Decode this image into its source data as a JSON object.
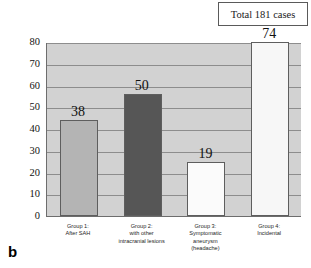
{
  "panel_letter": "b",
  "total_box": {
    "text": "Total 181 cases"
  },
  "chart_data": {
    "type": "bar",
    "title": "",
    "xlabel": "",
    "ylabel": "Number",
    "ylim": [
      0,
      80
    ],
    "yticks": [
      0,
      10,
      20,
      30,
      40,
      50,
      60,
      70,
      80
    ],
    "grid": true,
    "legend": "none",
    "annotations": [
      "Total 181 cases"
    ],
    "categories": [
      "Group 1: After SAH",
      "Group 2: with other intracranial lesions",
      "Group 3: Symptomatic aneurysm (headache)",
      "Group 4: Incidental"
    ],
    "category_lines": [
      [
        "Group 1:",
        "After SAH"
      ],
      [
        "Group 2:",
        "with other",
        "intracranial lesions"
      ],
      [
        "Group 3:",
        "Symptomatic",
        "aneurysm",
        "(headache)"
      ],
      [
        "Group 4:",
        "Incidental"
      ]
    ],
    "values": [
      38,
      50,
      19,
      74
    ],
    "drawn_heights": [
      44,
      56,
      25,
      80
    ],
    "bar_colors": [
      "#b4b4b4",
      "#565656",
      "#fbfbfb",
      "#f7f7f7"
    ],
    "total": 181
  }
}
